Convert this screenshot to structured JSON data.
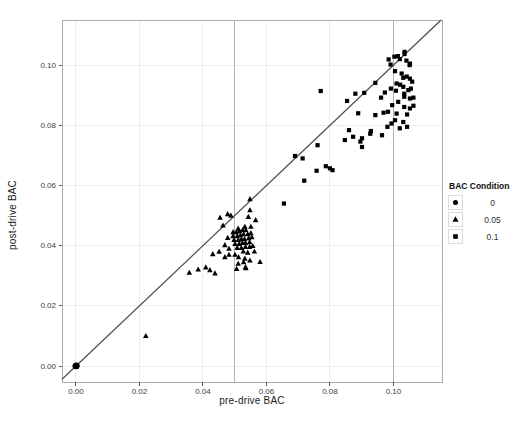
{
  "chart_data": {
    "type": "scatter",
    "title": "",
    "xlabel": "pre-drive BAC",
    "ylabel": "post-drive BAC",
    "xlim": [
      -0.0044,
      0.1153
    ],
    "ylim": [
      -0.0053,
      0.115
    ],
    "grid": true,
    "xticks": {
      "values": [
        0.0,
        0.02,
        0.04,
        0.06,
        0.08,
        0.1
      ],
      "labels": [
        "0.00",
        "0.02",
        "0.04",
        "0.06",
        "0.08",
        "0.10"
      ]
    },
    "yticks": {
      "values": [
        0.0,
        0.02,
        0.04,
        0.06,
        0.08,
        0.1
      ],
      "labels": [
        "0.00",
        "0.02",
        "0.04",
        "0.06",
        "0.08",
        "0.10"
      ]
    },
    "reference_lines_x": [
      0.05,
      0.1
    ],
    "identity_line": true,
    "legend": {
      "title": "BAC Condition",
      "position": "right",
      "entries": [
        {
          "label": "0",
          "marker": "circle"
        },
        {
          "label": "0.05",
          "marker": "triangle"
        },
        {
          "label": "0.1",
          "marker": "square"
        }
      ]
    },
    "colors": {
      "points": "#000000",
      "grid": "#ededed",
      "reference_line": "#b3b3b3",
      "identity_line": "#4d4d4d",
      "panel_border": "#ababab",
      "tick_mark": "#555555",
      "tick_text": "#3d3d3d"
    },
    "series": [
      {
        "name": "0",
        "marker": "circle",
        "points": [
          [
            0,
            0
          ],
          [
            0.0003,
            0.0002
          ],
          [
            -0.0002,
            0.0003
          ],
          [
            0.0002,
            -0.0002
          ],
          [
            -0.0003,
            -0.0002
          ],
          [
            0.0004,
            0.0003
          ],
          [
            0,
            0.0004
          ],
          [
            0.0003,
            -0.0003
          ],
          [
            -0.0004,
            0
          ],
          [
            0.0001,
            0.0001
          ],
          [
            -0.0001,
            -0.0003
          ],
          [
            0.0004,
            -0.0001
          ]
        ]
      },
      {
        "name": "0.05",
        "marker": "triangle",
        "points": [
          [
            0.022,
            0.01
          ],
          [
            0.0357,
            0.031
          ],
          [
            0.0385,
            0.0321
          ],
          [
            0.0409,
            0.0328
          ],
          [
            0.0422,
            0.0319
          ],
          [
            0.0438,
            0.0308
          ],
          [
            0.0431,
            0.0372
          ],
          [
            0.0451,
            0.038
          ],
          [
            0.0454,
            0.0493
          ],
          [
            0.0463,
            0.0467
          ],
          [
            0.0478,
            0.0505
          ],
          [
            0.0488,
            0.05
          ],
          [
            0.0469,
            0.0402
          ],
          [
            0.0478,
            0.0426
          ],
          [
            0.0469,
            0.0362
          ],
          [
            0.0482,
            0.039
          ],
          [
            0.0482,
            0.037
          ],
          [
            0.0495,
            0.0445
          ],
          [
            0.0505,
            0.0445
          ],
          [
            0.0515,
            0.0448
          ],
          [
            0.0525,
            0.0452
          ],
          [
            0.0535,
            0.0452
          ],
          [
            0.0495,
            0.0432
          ],
          [
            0.0508,
            0.0432
          ],
          [
            0.0518,
            0.0435
          ],
          [
            0.0528,
            0.0438
          ],
          [
            0.0541,
            0.0438
          ],
          [
            0.0551,
            0.0442
          ],
          [
            0.0498,
            0.0419
          ],
          [
            0.0511,
            0.0419
          ],
          [
            0.0521,
            0.0422
          ],
          [
            0.0531,
            0.0422
          ],
          [
            0.0544,
            0.0425
          ],
          [
            0.0554,
            0.0428
          ],
          [
            0.0501,
            0.0406
          ],
          [
            0.0514,
            0.0406
          ],
          [
            0.0524,
            0.0409
          ],
          [
            0.0534,
            0.0409
          ],
          [
            0.0547,
            0.0412
          ],
          [
            0.0508,
            0.0393
          ],
          [
            0.0521,
            0.0393
          ],
          [
            0.0534,
            0.0396
          ],
          [
            0.0547,
            0.0396
          ],
          [
            0.0557,
            0.0399
          ],
          [
            0.0501,
            0.037
          ],
          [
            0.0512,
            0.0362
          ],
          [
            0.0527,
            0.0381
          ],
          [
            0.0541,
            0.0377
          ],
          [
            0.0562,
            0.0381
          ],
          [
            0.0532,
            0.0357
          ],
          [
            0.0548,
            0.0351
          ],
          [
            0.0511,
            0.034
          ],
          [
            0.058,
            0.0346
          ],
          [
            0.0506,
            0.0323
          ],
          [
            0.0535,
            0.0325
          ],
          [
            0.0528,
            0.0345
          ],
          [
            0.0534,
            0.0329
          ],
          [
            0.0548,
            0.0555
          ],
          [
            0.0548,
            0.0518
          ],
          [
            0.0543,
            0.0496
          ],
          [
            0.0566,
            0.0485
          ],
          [
            0.0511,
            0.0457
          ],
          [
            0.0532,
            0.0463
          ],
          [
            0.0551,
            0.0463
          ]
        ]
      },
      {
        "name": "0.1",
        "marker": "square",
        "points": [
          [
            0.0655,
            0.054
          ],
          [
            0.069,
            0.0698
          ],
          [
            0.0714,
            0.069
          ],
          [
            0.0719,
            0.0616
          ],
          [
            0.0758,
            0.0649
          ],
          [
            0.0787,
            0.0664
          ],
          [
            0.08,
            0.0657
          ],
          [
            0.0761,
            0.0734
          ],
          [
            0.0808,
            0.0651
          ],
          [
            0.0771,
            0.0914
          ],
          [
            0.0847,
            0.0751
          ],
          [
            0.0854,
            0.0881
          ],
          [
            0.086,
            0.0784
          ],
          [
            0.0873,
            0.0762
          ],
          [
            0.088,
            0.0905
          ],
          [
            0.0889,
            0.084
          ],
          [
            0.0896,
            0.0746
          ],
          [
            0.0901,
            0.0728
          ],
          [
            0.0901,
            0.0757
          ],
          [
            0.0908,
            0.0908
          ],
          [
            0.0927,
            0.0772
          ],
          [
            0.0929,
            0.0781
          ],
          [
            0.0943,
            0.0941
          ],
          [
            0.0943,
            0.0834
          ],
          [
            0.0961,
            0.0892
          ],
          [
            0.0964,
            0.0767
          ],
          [
            0.0969,
            0.0842
          ],
          [
            0.0981,
            0.0795
          ],
          [
            0.0983,
            0.0845
          ],
          [
            0.0994,
            0.0806
          ],
          [
            0.0996,
            0.0867
          ],
          [
            0.102,
            0.079
          ],
          [
            0.1043,
            0.0795
          ],
          [
            0.1005,
            0.0817
          ],
          [
            0.1031,
            0.0811
          ],
          [
            0.1043,
            0.0836
          ],
          [
            0.0973,
            0.0909
          ],
          [
            0.0992,
            0.0922
          ],
          [
            0.1008,
            0.0915
          ],
          [
            0.101,
            0.0939
          ],
          [
            0.1021,
            0.0935
          ],
          [
            0.1031,
            0.0928
          ],
          [
            0.1047,
            0.0917
          ],
          [
            0.1055,
            0.0922
          ],
          [
            0.1034,
            0.0905
          ],
          [
            0.1034,
            0.0895
          ],
          [
            0.1052,
            0.0889
          ],
          [
            0.1063,
            0.0892
          ],
          [
            0.1015,
            0.0878
          ],
          [
            0.1034,
            0.0861
          ],
          [
            0.1052,
            0.0856
          ],
          [
            0.1063,
            0.0865
          ],
          [
            0.101,
            0.0839
          ],
          [
            0.1005,
            0.098
          ],
          [
            0.1026,
            0.0972
          ],
          [
            0.1031,
            0.0958
          ],
          [
            0.1042,
            0.0962
          ],
          [
            0.1052,
            0.0955
          ],
          [
            0.1059,
            0.0945
          ],
          [
            0.0985,
            0.1019
          ],
          [
            0.0991,
            0.1002
          ],
          [
            0.1003,
            0.1028
          ],
          [
            0.1014,
            0.103
          ],
          [
            0.102,
            0.102
          ],
          [
            0.1035,
            0.1044
          ],
          [
            0.1041,
            0.1015
          ],
          [
            0.1035,
            0.1037
          ],
          [
            0.1051,
            0.1
          ],
          [
            0.1052,
            0.1005
          ]
        ]
      }
    ]
  }
}
